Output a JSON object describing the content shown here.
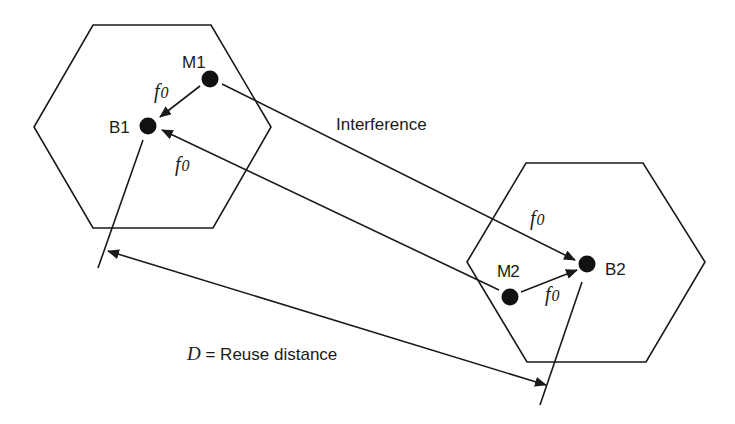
{
  "diagram": {
    "type": "cellular frequency reuse / co-channel interference",
    "cells": [
      {
        "id": "cell-1",
        "base_station": "B1",
        "mobile": "M1"
      },
      {
        "id": "cell-2",
        "base_station": "B2",
        "mobile": "M2"
      }
    ],
    "labels": {
      "m1": "M1",
      "b1": "B1",
      "m2": "M2",
      "b2": "B2",
      "interference": "Interference",
      "freq": "f",
      "freq_sub": "0",
      "distance_var": "D",
      "distance_eq": " = Reuse distance"
    },
    "links": [
      {
        "from": "M1",
        "to": "B1",
        "label": "f0",
        "kind": "uplink"
      },
      {
        "from": "M2",
        "to": "B1",
        "label": "f0",
        "kind": "interference"
      },
      {
        "from": "M1",
        "to": "B2",
        "label": "f0",
        "kind": "interference"
      },
      {
        "from": "M2",
        "to": "B2",
        "label": "f0",
        "kind": "uplink"
      }
    ],
    "colors": {
      "stroke": "#1a1a1a",
      "background": "#ffffff"
    }
  }
}
